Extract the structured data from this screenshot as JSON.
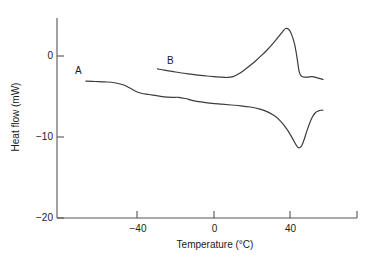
{
  "chart_data": {
    "type": "line",
    "title": "",
    "xlabel": "Temperature (°C)",
    "ylabel": "Heat flow (mW)",
    "xlim": [
      -68,
      57
    ],
    "ylim": [
      -20,
      4.5
    ],
    "xticks": [
      -40,
      0,
      40
    ],
    "xtick_labels": [
      "−40",
      "0",
      "40"
    ],
    "yticks": [
      0,
      -10,
      -20
    ],
    "ytick_labels": [
      "0",
      "−10",
      "−20"
    ],
    "grid": false,
    "legend": "none",
    "annotations": [
      {
        "text": "A",
        "x": -56,
        "y": -1.6,
        "curve": "A"
      },
      {
        "text": "B",
        "x": -22,
        "y": 0.4,
        "curve": "B"
      }
    ],
    "series": [
      {
        "name": "A",
        "label": "A",
        "description": "Lower trace – endothermic melting peak near 44 °C",
        "color": "#3c3c3c",
        "points": [
          [
            -67.0,
            -3.1
          ],
          [
            -62.0,
            -3.15
          ],
          [
            -57.0,
            -3.2
          ],
          [
            -52.0,
            -3.3
          ],
          [
            -47.5,
            -3.55
          ],
          [
            -44.0,
            -3.95
          ],
          [
            -41.0,
            -4.35
          ],
          [
            -38.0,
            -4.6
          ],
          [
            -34.0,
            -4.75
          ],
          [
            -30.0,
            -4.9
          ],
          [
            -26.0,
            -5.05
          ],
          [
            -22.0,
            -5.1
          ],
          [
            -18.5,
            -5.1
          ],
          [
            -15.0,
            -5.25
          ],
          [
            -11.0,
            -5.5
          ],
          [
            -6.0,
            -5.7
          ],
          [
            -1.0,
            -5.85
          ],
          [
            4.0,
            -5.95
          ],
          [
            9.0,
            -6.05
          ],
          [
            14.0,
            -6.15
          ],
          [
            19.0,
            -6.3
          ],
          [
            24.0,
            -6.55
          ],
          [
            28.0,
            -6.9
          ],
          [
            32.0,
            -7.45
          ],
          [
            35.0,
            -8.1
          ],
          [
            38.0,
            -9.0
          ],
          [
            40.5,
            -9.95
          ],
          [
            42.5,
            -10.8
          ],
          [
            44.0,
            -11.3
          ],
          [
            45.5,
            -11.2
          ],
          [
            47.0,
            -10.4
          ],
          [
            48.5,
            -9.3
          ],
          [
            50.0,
            -8.3
          ],
          [
            51.5,
            -7.5
          ],
          [
            53.0,
            -7.0
          ],
          [
            54.5,
            -6.8
          ],
          [
            56.0,
            -6.7
          ],
          [
            57.0,
            -6.7
          ]
        ]
      },
      {
        "name": "B",
        "label": "B",
        "description": "Upper trace – exothermic crystallization peak near 38 °C",
        "color": "#3c3c3c",
        "points": [
          [
            -29.5,
            -1.6
          ],
          [
            -26.0,
            -1.75
          ],
          [
            -22.0,
            -1.9
          ],
          [
            -17.0,
            -2.1
          ],
          [
            -12.0,
            -2.25
          ],
          [
            -7.0,
            -2.4
          ],
          [
            -2.0,
            -2.5
          ],
          [
            3.0,
            -2.6
          ],
          [
            7.0,
            -2.65
          ],
          [
            10.0,
            -2.55
          ],
          [
            13.0,
            -2.2
          ],
          [
            16.0,
            -1.7
          ],
          [
            19.0,
            -1.15
          ],
          [
            22.0,
            -0.55
          ],
          [
            25.0,
            0.1
          ],
          [
            28.0,
            0.8
          ],
          [
            31.0,
            1.6
          ],
          [
            34.0,
            2.45
          ],
          [
            36.0,
            3.05
          ],
          [
            37.5,
            3.4
          ],
          [
            39.0,
            3.3
          ],
          [
            40.5,
            2.7
          ],
          [
            42.0,
            1.6
          ],
          [
            43.0,
            0.4
          ],
          [
            43.8,
            -0.85
          ],
          [
            44.5,
            -1.9
          ],
          [
            45.5,
            -2.45
          ],
          [
            47.0,
            -2.6
          ],
          [
            49.0,
            -2.6
          ],
          [
            51.5,
            -2.55
          ],
          [
            54.0,
            -2.7
          ],
          [
            56.5,
            -2.85
          ],
          [
            57.0,
            -2.9
          ]
        ]
      }
    ]
  }
}
